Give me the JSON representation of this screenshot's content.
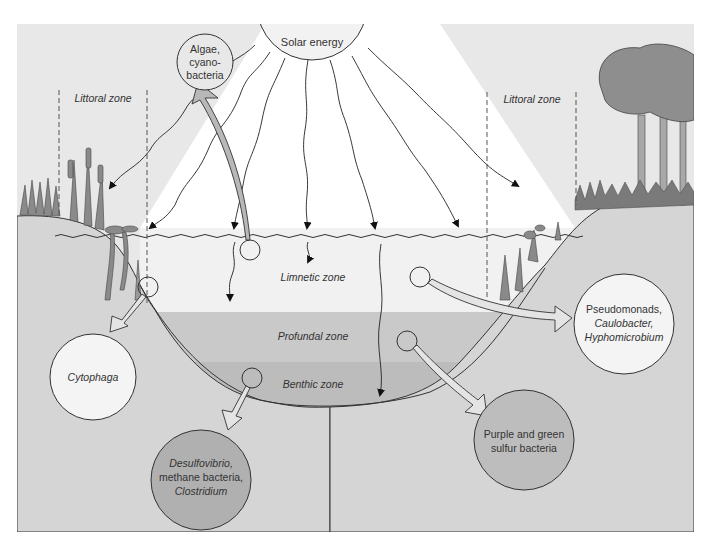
{
  "diagram": {
    "colors": {
      "background": "#e8e8e8",
      "sky": "#e6e6e6",
      "light_cone": "#ffffff",
      "limnetic": "#f0f0f0",
      "profundal": "#c8c8c8",
      "benthic": "#bdbdbd",
      "bank": "#d6d6d6",
      "arrow_fill": "#e4e4e4",
      "algae_arrow_fill": "#b8b8b8",
      "vegetation": "#8a8a8a",
      "outline": "#333333"
    },
    "sun": {
      "label": "Solar energy"
    },
    "zones": {
      "littoral_left": "Littoral zone",
      "littoral_right": "Littoral zone",
      "limnetic": "Limnetic zone",
      "profundal": "Profundal zone",
      "benthic": "Benthic zone"
    },
    "organisms": {
      "algae": {
        "line1": "Algae,",
        "line2": "cyano-",
        "line3": "bacteria"
      },
      "cytophaga": {
        "line1": "Cytophaga"
      },
      "pseudomonads": {
        "line1": "Pseudomonads,",
        "line2": "Caulobacter,",
        "line3": "Hyphomicrobium"
      },
      "purple_green": {
        "line1": "Purple and green",
        "line2": "sulfur bacteria"
      },
      "desulfovibrio": {
        "line1": "Desulfovibrio,",
        "line2": "methane bacteria,",
        "line3": "Clostridium"
      }
    }
  }
}
